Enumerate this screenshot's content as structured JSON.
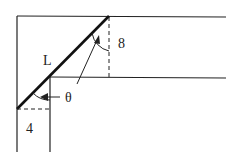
{
  "diagram": {
    "labels": {
      "ladder": "L",
      "hall_width_top": "8",
      "angle": "θ",
      "hall_width_bottom": "4"
    },
    "colors": {
      "line": "#222222",
      "background": "#ffffff"
    }
  }
}
